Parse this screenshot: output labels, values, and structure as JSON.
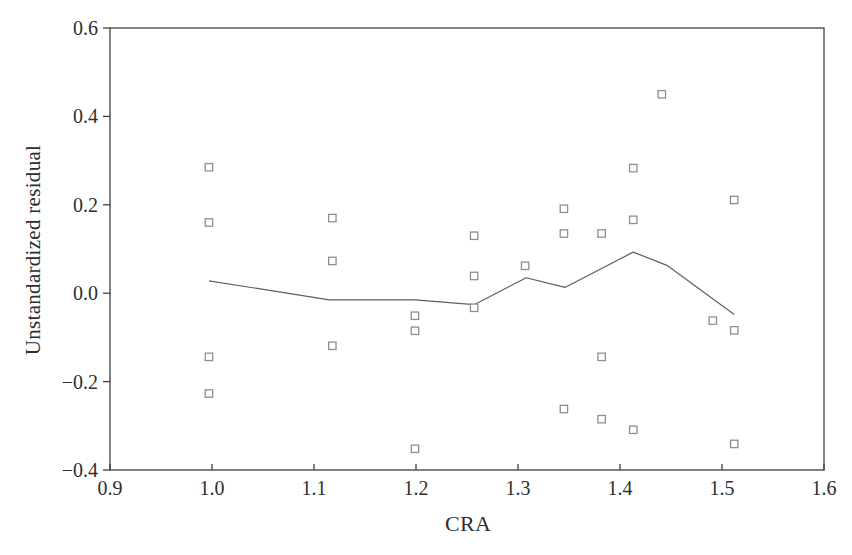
{
  "chart_data": {
    "type": "scatter",
    "title": "",
    "xlabel": "CRA",
    "ylabel": "Unstandardized residual",
    "xlim": [
      0.9,
      1.6
    ],
    "ylim": [
      -0.4,
      0.6
    ],
    "x_ticks": [
      0.9,
      1.0,
      1.1,
      1.2,
      1.3,
      1.4,
      1.5,
      1.6
    ],
    "x_tick_labels": [
      "0.9",
      "1.0",
      "1.1",
      "1.2",
      "1.3",
      "1.4",
      "1.5",
      "1.6"
    ],
    "y_ticks": [
      0.6,
      0.4,
      0.2,
      0.0,
      -0.2,
      -0.4
    ],
    "y_tick_labels": [
      "0.6",
      "0.4",
      "0.2",
      "0.0",
      "−0.2",
      "−0.4"
    ],
    "grid": false,
    "legend": null,
    "marker": "open-square",
    "points": [
      [
        0.997,
        0.285
      ],
      [
        0.997,
        0.16
      ],
      [
        0.997,
        -0.144
      ],
      [
        0.997,
        -0.227
      ],
      [
        1.118,
        0.17
      ],
      [
        1.118,
        0.073
      ],
      [
        1.118,
        -0.119
      ],
      [
        1.199,
        -0.051
      ],
      [
        1.199,
        -0.085
      ],
      [
        1.199,
        -0.352
      ],
      [
        1.257,
        0.13
      ],
      [
        1.257,
        0.039
      ],
      [
        1.257,
        -0.033
      ],
      [
        1.307,
        0.062
      ],
      [
        1.345,
        0.191
      ],
      [
        1.345,
        0.135
      ],
      [
        1.345,
        -0.262
      ],
      [
        1.382,
        0.135
      ],
      [
        1.382,
        -0.144
      ],
      [
        1.382,
        -0.285
      ],
      [
        1.413,
        0.283
      ],
      [
        1.413,
        0.166
      ],
      [
        1.413,
        -0.309
      ],
      [
        1.441,
        0.45
      ],
      [
        1.491,
        -0.062
      ],
      [
        1.512,
        0.211
      ],
      [
        1.512,
        -0.084
      ],
      [
        1.512,
        -0.341
      ]
    ],
    "fit_line": [
      [
        0.997,
        0.028
      ],
      [
        1.115,
        -0.015
      ],
      [
        1.199,
        -0.015
      ],
      [
        1.257,
        -0.026
      ],
      [
        1.308,
        0.035
      ],
      [
        1.346,
        0.013
      ],
      [
        1.413,
        0.093
      ],
      [
        1.446,
        0.063
      ],
      [
        1.512,
        -0.048
      ]
    ],
    "colors": {
      "background": "#ffffff",
      "axis": "#3f3f3f",
      "text": "#2e2e2e",
      "marker": "#8f8f8f",
      "marker_fill": "#ffffff",
      "line": "#5f5f5f"
    }
  }
}
